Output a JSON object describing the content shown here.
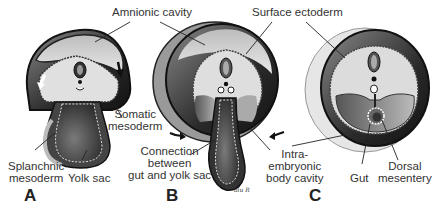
{
  "labels": {
    "amnionic_cavity": "Amnionic cavity",
    "surface_ectoderm": "Surface ectoderm",
    "somatic_mesoderm_1": "Somatic",
    "somatic_mesoderm_2": "mesoderm",
    "splanchnic_mesoderm_1": "Splanchnic",
    "splanchnic_mesoderm_2": "mesoderm",
    "yolk_sac": "Yolk sac",
    "connection_1": "Connection",
    "connection_2": "between",
    "connection_3": "gut and yolk sac",
    "intra_1": "Intra-",
    "intra_2": "embryonic",
    "intra_3": "body cavity",
    "gut": "Gut",
    "dorsal_mesentery_1": "Dorsal",
    "dorsal_mesentery_2": "mesentery"
  },
  "panels": {
    "a": "A",
    "b": "B",
    "c": "C"
  },
  "signature": "alu R",
  "colors": {
    "dark": "#1e1e1e",
    "mid": "#6a6a6a",
    "light": "#c8c8c8",
    "pale": "#e4e4e4",
    "label": "#333333"
  }
}
